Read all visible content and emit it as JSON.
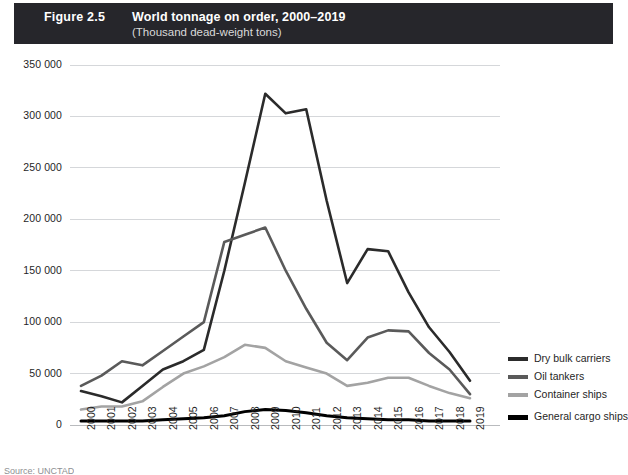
{
  "header": {
    "figure_number": "Figure 2.5",
    "title": "World tonnage on order, 2000–2019",
    "subtitle": "(Thousand dead-weight tons)",
    "bar_color": "#26262b"
  },
  "source": {
    "text": "Source: UNCTAD"
  },
  "legend": {
    "position": "right",
    "items": [
      {
        "label": "Dry bulk carriers",
        "color": "#2b2b2b"
      },
      {
        "label": "Oil tankers",
        "color": "#5a5a5a"
      },
      {
        "label": "Container ships",
        "color": "#a3a3a3"
      },
      {
        "label": "General cargo ships",
        "color": "#000000"
      }
    ]
  },
  "chart_data": {
    "type": "line",
    "title": "World tonnage on order, 2000–2019",
    "subtitle": "(Thousand dead-weight tons)",
    "xlabel": "",
    "ylabel": "",
    "ylim": [
      0,
      350000
    ],
    "ytick_step": 50000,
    "ytick_labels": [
      "0",
      "50 000",
      "100 000",
      "150 000",
      "200 000",
      "250 000",
      "300 000",
      "350 000"
    ],
    "ytick_values": [
      0,
      50000,
      100000,
      150000,
      200000,
      250000,
      300000,
      350000
    ],
    "grid": true,
    "grid_axis": "y",
    "legend_position": "right",
    "categories": [
      "2000",
      "2001",
      "2002",
      "2003",
      "2004",
      "2005",
      "2006",
      "2007",
      "2008",
      "2009",
      "2010",
      "2011",
      "2012",
      "2013",
      "2014",
      "2015",
      "2016",
      "2017",
      "2018",
      "2019"
    ],
    "series": [
      {
        "name": "Dry bulk carriers",
        "color": "#2b2b2b",
        "values": [
          33000,
          28000,
          22000,
          38000,
          54000,
          62000,
          73000,
          150000,
          235000,
          322000,
          303000,
          307000,
          218000,
          138000,
          171000,
          169000,
          129000,
          95000,
          71000,
          43000
        ]
      },
      {
        "name": "Oil tankers",
        "color": "#5a5a5a",
        "values": [
          38000,
          48000,
          62000,
          58000,
          72000,
          86000,
          100000,
          178000,
          185000,
          192000,
          150000,
          113000,
          80000,
          63000,
          85000,
          92000,
          91000,
          70000,
          54000,
          30000
        ]
      },
      {
        "name": "Container ships",
        "color": "#a3a3a3",
        "values": [
          15000,
          18000,
          18000,
          23000,
          37000,
          50000,
          57000,
          66000,
          78000,
          75000,
          62000,
          56000,
          50000,
          38000,
          41000,
          46000,
          46000,
          38000,
          31000,
          26000
        ]
      },
      {
        "name": "General cargo ships",
        "color": "#000000",
        "values": [
          4000,
          4000,
          4000,
          4000,
          5000,
          6000,
          7000,
          9000,
          13000,
          15000,
          14000,
          12000,
          9000,
          7000,
          6000,
          5000,
          5000,
          4000,
          4000,
          4000
        ]
      }
    ]
  }
}
